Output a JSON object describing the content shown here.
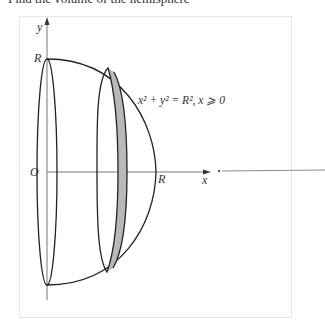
{
  "header": {
    "cut_text": "Find the volume of the hemisphere"
  },
  "figure": {
    "axis_x_label": "x",
    "axis_y_label": "y",
    "origin_label": "O",
    "radius_label_top": "R",
    "radius_label_right": "R",
    "equation": "x² + y² = R², x ⩾ 0",
    "colors": {
      "stroke": "#222222",
      "axis": "#777777",
      "shade": "#b8b8b8"
    }
  }
}
